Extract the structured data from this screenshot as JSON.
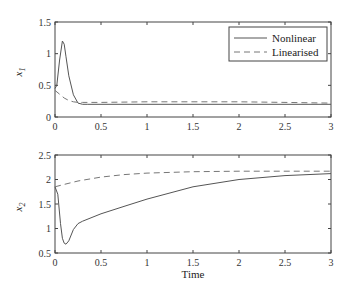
{
  "chart_data": [
    {
      "type": "line",
      "title": "",
      "xlabel": "",
      "ylabel": "x1",
      "ylabel_main": "x",
      "ylabel_sub": "1",
      "xlim": [
        0,
        3
      ],
      "ylim": [
        0,
        1.5
      ],
      "xticks": [
        0,
        0.5,
        1,
        1.5,
        2,
        2.5,
        3
      ],
      "xtick_labels": [
        "0",
        "0.5",
        "1",
        "1.5",
        "2",
        "2.5",
        "3"
      ],
      "yticks": [
        0,
        0.5,
        1,
        1.5
      ],
      "ytick_labels": [
        "0",
        "0.5",
        "1",
        "1.5"
      ],
      "grid": false,
      "legend_position": "upper right",
      "series": [
        {
          "name": "Nonlinear",
          "style": "solid",
          "x": [
            0,
            0.02,
            0.05,
            0.08,
            0.1,
            0.12,
            0.15,
            0.2,
            0.25,
            0.3,
            0.35,
            0.5,
            1,
            1.5,
            2,
            2.5,
            3
          ],
          "y": [
            0.45,
            0.5,
            0.9,
            1.2,
            1.15,
            0.95,
            0.65,
            0.35,
            0.22,
            0.2,
            0.2,
            0.2,
            0.2,
            0.2,
            0.2,
            0.2,
            0.2
          ]
        },
        {
          "name": "Linearised",
          "style": "dashed",
          "x": [
            0,
            0.05,
            0.1,
            0.15,
            0.2,
            0.25,
            0.3,
            0.5,
            1,
            1.5,
            2,
            2.5,
            3
          ],
          "y": [
            0.42,
            0.36,
            0.3,
            0.26,
            0.24,
            0.23,
            0.23,
            0.23,
            0.24,
            0.24,
            0.24,
            0.23,
            0.22
          ]
        }
      ]
    },
    {
      "type": "line",
      "title": "",
      "xlabel": "Time",
      "ylabel": "x2",
      "ylabel_main": "x",
      "ylabel_sub": "2",
      "xlim": [
        0,
        3
      ],
      "ylim": [
        0.5,
        2.5
      ],
      "xticks": [
        0,
        0.5,
        1,
        1.5,
        2,
        2.5,
        3
      ],
      "xtick_labels": [
        "0",
        "0.5",
        "1",
        "1.5",
        "2",
        "2.5",
        "3"
      ],
      "yticks": [
        0.5,
        1,
        1.5,
        2,
        2.5
      ],
      "ytick_labels": [
        "0.5",
        "1",
        "1.5",
        "2",
        "2.5"
      ],
      "grid": false,
      "series": [
        {
          "name": "Nonlinear",
          "style": "solid",
          "x": [
            0,
            0.03,
            0.06,
            0.08,
            0.1,
            0.12,
            0.15,
            0.2,
            0.25,
            0.3,
            0.5,
            0.75,
            1,
            1.5,
            2,
            2.5,
            3
          ],
          "y": [
            1.85,
            1.7,
            1.1,
            0.8,
            0.7,
            0.68,
            0.75,
            0.98,
            1.1,
            1.15,
            1.3,
            1.45,
            1.6,
            1.85,
            2.0,
            2.08,
            2.12
          ]
        },
        {
          "name": "Linearised",
          "style": "dashed",
          "x": [
            0,
            0.1,
            0.25,
            0.5,
            0.75,
            1,
            1.5,
            2,
            2.5,
            3
          ],
          "y": [
            1.85,
            1.9,
            1.97,
            2.05,
            2.1,
            2.13,
            2.16,
            2.17,
            2.17,
            2.17
          ]
        }
      ]
    }
  ],
  "legend": {
    "items": [
      {
        "label": "Nonlinear",
        "style": "solid"
      },
      {
        "label": "Linearised",
        "style": "dashed"
      }
    ]
  },
  "colors": {
    "nonlinear": "#555555",
    "linearised": "#777777",
    "axes": "#444444"
  }
}
